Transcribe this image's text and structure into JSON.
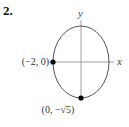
{
  "problem_number": "2.",
  "diagram": {
    "type": "ellipse",
    "axes": {
      "x_label": "x",
      "y_label": "y"
    },
    "ellipse": {
      "center": [
        0,
        0
      ],
      "semi_axis_x": 2,
      "semi_axis_y": "√5"
    },
    "points": [
      {
        "label": "(−2, 0)",
        "coords": [
          -2,
          0
        ]
      },
      {
        "label": "(0, −√5)",
        "coords": [
          0,
          "-√5"
        ]
      }
    ],
    "colors": {
      "curve": "#555555",
      "axes": "#888888",
      "points": "#000000"
    }
  }
}
